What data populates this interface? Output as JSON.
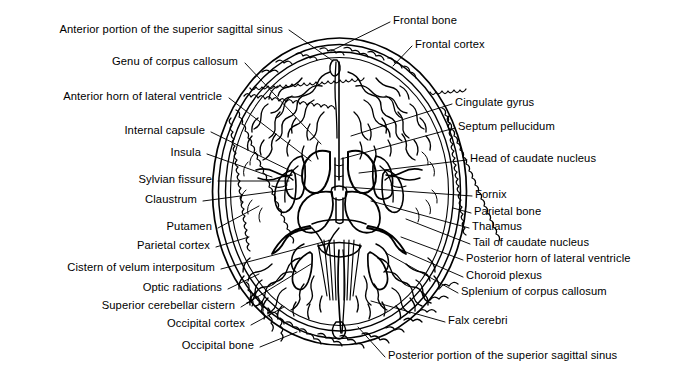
{
  "figure": {
    "ink_color": "#000000",
    "background_color": "#ffffff"
  },
  "labels_left": [
    {
      "id": "anterior-portion-superior-sagittal-sinus",
      "text": "Anterior portion of the superior sagittal sinus",
      "x": 283,
      "y": 29,
      "leader_to_x": 333,
      "leader_to_y": 60
    },
    {
      "id": "genu-of-corpus-callosum",
      "text": "Genu of corpus callosum",
      "x": 238,
      "y": 61,
      "leader_to_x": 320,
      "leader_to_y": 143
    },
    {
      "id": "anterior-horn-of-lateral-ventricle",
      "text": "Anterior horn of lateral ventricle",
      "x": 222,
      "y": 96,
      "leader_to_x": 310,
      "leader_to_y": 160
    },
    {
      "id": "internal-capsule",
      "text": "Internal capsule",
      "x": 205,
      "y": 130,
      "leader_to_x": 300,
      "leader_to_y": 175
    },
    {
      "id": "insula",
      "text": "Insula",
      "x": 201,
      "y": 152,
      "leader_to_x": 272,
      "leader_to_y": 176
    },
    {
      "id": "sylvian-fissure",
      "text": "Sylvian fissure",
      "x": 212,
      "y": 179,
      "leader_to_x": 288,
      "leader_to_y": 180
    },
    {
      "id": "claustrum",
      "text": "Claustrum",
      "x": 197,
      "y": 199,
      "leader_to_x": 292,
      "leader_to_y": 188
    },
    {
      "id": "putamen",
      "text": "Putamen",
      "x": 212,
      "y": 226,
      "leader_to_x": 258,
      "leader_to_y": 205
    },
    {
      "id": "parietal-cortex",
      "text": "Parietal cortex",
      "x": 210,
      "y": 245,
      "leader_to_x": 248,
      "leader_to_y": 235
    },
    {
      "id": "cistern-of-velum-interpositum",
      "text": "Cistern of velum interpositum",
      "x": 215,
      "y": 267,
      "leader_to_x": 330,
      "leader_to_y": 238
    },
    {
      "id": "optic-radiations",
      "text": "Optic radiations",
      "x": 222,
      "y": 287,
      "leader_to_x": 258,
      "leader_to_y": 272
    },
    {
      "id": "superior-cerebellar-cistern",
      "text": "Superior cerebellar cistern",
      "x": 235,
      "y": 305,
      "leader_to_x": 310,
      "leader_to_y": 262
    },
    {
      "id": "occipital-cortex",
      "text": "Occipital cortex",
      "x": 245,
      "y": 323,
      "leader_to_x": 283,
      "leader_to_y": 305
    },
    {
      "id": "occipital-bone",
      "text": "Occipital bone",
      "x": 254,
      "y": 345,
      "leader_to_x": 296,
      "leader_to_y": 330
    }
  ],
  "labels_right": [
    {
      "id": "frontal-bone",
      "text": "Frontal bone",
      "x": 393,
      "y": 20,
      "leader_to_x": 330,
      "leader_to_y": 50
    },
    {
      "id": "frontal-cortex",
      "text": "Frontal cortex",
      "x": 415,
      "y": 44,
      "leader_to_x": 392,
      "leader_to_y": 65
    },
    {
      "id": "cingulate-gyrus",
      "text": "Cingulate gyrus",
      "x": 455,
      "y": 102,
      "leader_to_x": 350,
      "leader_to_y": 135
    },
    {
      "id": "septum-pellucidum",
      "text": "Septum pellucidum",
      "x": 458,
      "y": 126,
      "leader_to_x": 340,
      "leader_to_y": 158
    },
    {
      "id": "head-of-caudate-nucleus",
      "text": "Head of caudate nucleus",
      "x": 470,
      "y": 158,
      "leader_to_x": 358,
      "leader_to_y": 172
    },
    {
      "id": "fornix",
      "text": "Fornix",
      "x": 475,
      "y": 194,
      "leader_to_x": 345,
      "leader_to_y": 186
    },
    {
      "id": "parietal-bone",
      "text": "Parietal bone",
      "x": 474,
      "y": 211,
      "leader_to_x": 452,
      "leader_to_y": 206
    },
    {
      "id": "thalamus",
      "text": "Thalamus",
      "x": 472,
      "y": 226,
      "leader_to_x": 370,
      "leader_to_y": 200
    },
    {
      "id": "tail-of-caudate-nucleus",
      "text": "Tail of caudate nucleus",
      "x": 473,
      "y": 242,
      "leader_to_x": 405,
      "leader_to_y": 218
    },
    {
      "id": "posterior-horn-of-lateral-ventricle",
      "text": "Posterior horn of lateral ventricle",
      "x": 466,
      "y": 258,
      "leader_to_x": 400,
      "leader_to_y": 236
    },
    {
      "id": "choroid-plexus",
      "text": "Choroid plexus",
      "x": 466,
      "y": 275,
      "leader_to_x": 398,
      "leader_to_y": 248
    },
    {
      "id": "splenium-of-corpus-callosum",
      "text": "Splenium of corpus callosum",
      "x": 461,
      "y": 291,
      "leader_to_x": 385,
      "leader_to_y": 252
    },
    {
      "id": "falx-cerebri",
      "text": "Falx cerebri",
      "x": 448,
      "y": 320,
      "leader_to_x": 370,
      "leader_to_y": 300
    },
    {
      "id": "posterior-portion-superior-sagittal-sinus",
      "text": "Posterior portion of the superior sagittal sinus",
      "x": 388,
      "y": 355,
      "leader_to_x": 357,
      "leader_to_y": 326
    }
  ]
}
